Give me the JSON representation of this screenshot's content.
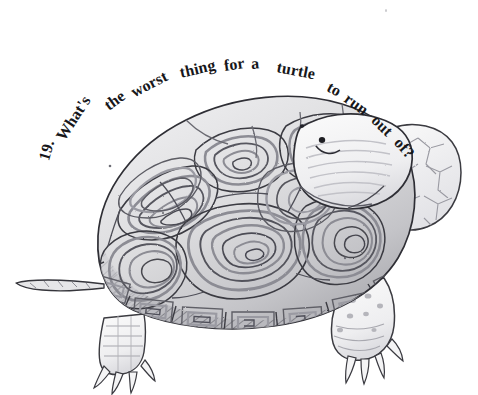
{
  "illustration": {
    "kind": "pen-and-ink wash drawing",
    "subject": "diamondback terrapin turtle in side profile facing right",
    "background_color": "#ffffff",
    "ink_color": "#17171a",
    "shell_tone": "#d8d8da",
    "shell_shadow_tone": "#9a9a9f",
    "skin_tone": "#f2f2f3"
  },
  "riddle": {
    "number": "19.",
    "full_text": "19. What's the worst thing for a turtle to run out of?",
    "words": [
      {
        "text": "19.",
        "x": 44,
        "y": 160,
        "rot": -74,
        "size": 16
      },
      {
        "text": "What's",
        "x": 60,
        "y": 139,
        "rot": -57,
        "size": 16
      },
      {
        "text": "the",
        "x": 106,
        "y": 107,
        "rot": -36,
        "size": 16
      },
      {
        "text": "worst",
        "x": 132,
        "y": 93,
        "rot": -27,
        "size": 16
      },
      {
        "text": "thing",
        "x": 180,
        "y": 73,
        "rot": -13,
        "size": 16
      },
      {
        "text": "for",
        "x": 224,
        "y": 66,
        "rot": -8,
        "size": 16
      },
      {
        "text": "a",
        "x": 251,
        "y": 64,
        "rot": -5,
        "size": 16
      },
      {
        "text": "turtle",
        "x": 277,
        "y": 67,
        "rot": 11,
        "size": 16
      },
      {
        "text": "to",
        "x": 328,
        "y": 86,
        "rot": 28,
        "size": 16
      },
      {
        "text": "run",
        "x": 346,
        "y": 97,
        "rot": 36,
        "size": 16
      },
      {
        "text": "out",
        "x": 374,
        "y": 118,
        "rot": 44,
        "size": 16
      },
      {
        "text": "of?",
        "x": 397,
        "y": 140,
        "rot": 48,
        "size": 16
      }
    ]
  },
  "turtle_parts": {
    "shell": "carapace-with-concentric-scutes",
    "head": "head-facing-right",
    "eye": "eye",
    "nostril": "nostril",
    "neck": "scaly-neck",
    "front_leg": "front-leg-with-claws",
    "rear_leg": "rear-leg-spotted-with-claws",
    "tail": "tail"
  }
}
